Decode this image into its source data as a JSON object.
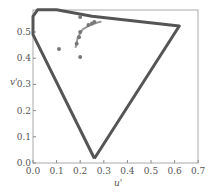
{
  "chart_data": {
    "type": "scatter",
    "title": "",
    "xlabel": "u'",
    "ylabel": "v'",
    "xlim": [
      0.0,
      0.7
    ],
    "ylim": [
      0.0,
      0.6
    ],
    "xticks": [
      "0.0",
      "0.1",
      "0.2",
      "0.3",
      "0.4",
      "0.5",
      "0.6",
      "0.7"
    ],
    "yticks": [
      "0.0",
      "0.1",
      "0.2",
      "0.3",
      "0.4",
      "0.5"
    ],
    "grid": false,
    "legend": null,
    "series": [
      {
        "name": "spectral-locus",
        "kind": "line",
        "color": "#555555",
        "points": [
          [
            0.26,
            0.017
          ],
          [
            0.0,
            0.49
          ],
          [
            0.0,
            0.56
          ],
          [
            0.02,
            0.585
          ],
          [
            0.1,
            0.585
          ],
          [
            0.25,
            0.56
          ],
          [
            0.62,
            0.523
          ],
          [
            0.26,
            0.017
          ]
        ]
      },
      {
        "name": "planckian-locus",
        "kind": "line",
        "color": "#999999",
        "points": [
          [
            0.18,
            0.44
          ],
          [
            0.19,
            0.48
          ],
          [
            0.21,
            0.51
          ],
          [
            0.24,
            0.525
          ],
          [
            0.27,
            0.535
          ],
          [
            0.29,
            0.54
          ]
        ]
      },
      {
        "name": "measurements",
        "kind": "scatter",
        "color": "#777777",
        "points": [
          [
            0.11,
            0.435
          ],
          [
            0.2,
            0.557
          ],
          [
            0.2,
            0.5
          ],
          [
            0.195,
            0.48
          ],
          [
            0.185,
            0.455
          ],
          [
            0.2,
            0.405
          ],
          [
            0.235,
            0.527
          ],
          [
            0.25,
            0.532
          ],
          [
            0.26,
            0.538
          ]
        ]
      }
    ]
  }
}
